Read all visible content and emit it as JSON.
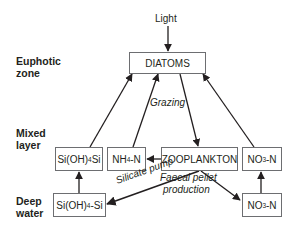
{
  "diagram": {
    "title_input": "Light",
    "zones": {
      "euphotic": [
        "Euphotic",
        "zone"
      ],
      "mixed": [
        "Mixed",
        "layer"
      ],
      "deep": [
        "Deep",
        "water"
      ]
    },
    "nodes": {
      "diatoms": "DIATOMS",
      "silicate_mixed": {
        "pre": "Si(OH)",
        "sub": "4",
        "post": "Si"
      },
      "ammonium_mixed": {
        "pre": "NH",
        "sub": "4",
        "post": "-N"
      },
      "zooplankton": "ZOOPLANKTON",
      "nitrate_mixed": {
        "pre": "NO",
        "sub": "3",
        "post": "-N"
      },
      "silicate_deep": {
        "pre": "Si(OH)",
        "sub": "4",
        "post": "-Si"
      },
      "nitrate_deep": {
        "pre": "NO",
        "sub": "3",
        "post": "-N"
      }
    },
    "edge_labels": {
      "grazing": "Grazing",
      "silicate_pump": "Silicate pump",
      "faecal_1": "Faecal pellet",
      "faecal_2": "production"
    },
    "edges": [
      {
        "from": "Light",
        "to": "DIATOMS"
      },
      {
        "from": "Si(OH)4Si",
        "to": "DIATOMS"
      },
      {
        "from": "NH4-N",
        "to": "DIATOMS"
      },
      {
        "from": "DIATOMS",
        "to": "ZOOPLANKTON",
        "label": "Grazing"
      },
      {
        "from": "NO3-N (mixed)",
        "to": "DIATOMS"
      },
      {
        "from": "ZOOPLANKTON",
        "to": "NH4-N"
      },
      {
        "from": "ZOOPLANKTON",
        "to": "Si(OH)4-Si (deep)",
        "label": "Silicate pump"
      },
      {
        "from": "ZOOPLANKTON",
        "to": "NO3-N (deep)",
        "label": "Faecal pellet production"
      },
      {
        "from": "Si(OH)4-Si (deep)",
        "to": "Si(OH)4Si (mixed)"
      },
      {
        "from": "NO3-N (deep)",
        "to": "NO3-N (mixed)"
      }
    ],
    "colors": {
      "line": "#231f20",
      "box_border": "#6d6e71",
      "text": "#231f20"
    }
  }
}
